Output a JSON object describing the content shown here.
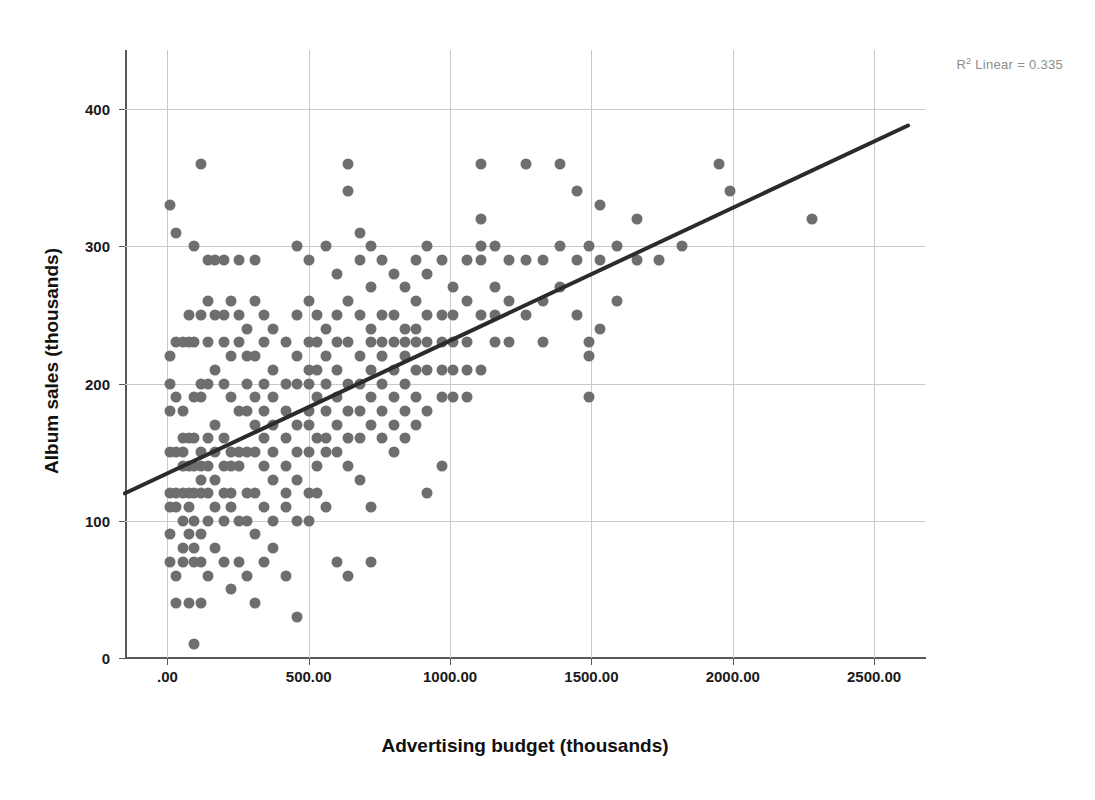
{
  "chart_data": {
    "type": "scatter",
    "title": "",
    "xlabel": "Advertising budget (thousands)",
    "ylabel": "Album sales (thousands)",
    "xlim": [
      -150,
      2680
    ],
    "ylim": [
      0,
      443
    ],
    "grid": true,
    "legend": "none",
    "annotations": [
      {
        "name": "r-squared",
        "text_prefix": "R",
        "text_sup": "2",
        "text_suffix": " Linear = 0.335",
        "value": 0.335,
        "position": "top-right"
      }
    ],
    "xticks": [
      0,
      500,
      1000,
      1500,
      2000,
      2500
    ],
    "xtick_labels": [
      ".00",
      "500.00",
      "1000.00",
      "1500.00",
      "2000.00",
      "2500.00"
    ],
    "yticks": [
      0,
      100,
      200,
      300,
      400
    ],
    "ytick_labels": [
      "0",
      "100",
      "200",
      "300",
      "400"
    ],
    "series": [
      {
        "name": "Album sales vs Advertising budget",
        "marker": "circle",
        "color": "#6e6e6e",
        "points": [
          [
            10,
            330
          ],
          [
            10,
            220
          ],
          [
            10,
            200
          ],
          [
            10,
            180
          ],
          [
            10,
            150
          ],
          [
            10,
            120
          ],
          [
            10,
            110
          ],
          [
            10,
            90
          ],
          [
            10,
            70
          ],
          [
            30,
            310
          ],
          [
            30,
            230
          ],
          [
            30,
            190
          ],
          [
            30,
            150
          ],
          [
            30,
            120
          ],
          [
            30,
            110
          ],
          [
            30,
            60
          ],
          [
            30,
            40
          ],
          [
            55,
            230
          ],
          [
            55,
            180
          ],
          [
            55,
            160
          ],
          [
            55,
            150
          ],
          [
            55,
            140
          ],
          [
            55,
            120
          ],
          [
            55,
            100
          ],
          [
            55,
            80
          ],
          [
            55,
            70
          ],
          [
            75,
            250
          ],
          [
            75,
            230
          ],
          [
            75,
            160
          ],
          [
            75,
            140
          ],
          [
            75,
            120
          ],
          [
            75,
            110
          ],
          [
            75,
            90
          ],
          [
            75,
            40
          ],
          [
            95,
            300
          ],
          [
            95,
            230
          ],
          [
            95,
            190
          ],
          [
            95,
            160
          ],
          [
            95,
            140
          ],
          [
            95,
            120
          ],
          [
            95,
            100
          ],
          [
            95,
            80
          ],
          [
            95,
            70
          ],
          [
            95,
            10
          ],
          [
            120,
            360
          ],
          [
            120,
            250
          ],
          [
            120,
            200
          ],
          [
            120,
            190
          ],
          [
            120,
            150
          ],
          [
            120,
            140
          ],
          [
            120,
            130
          ],
          [
            120,
            120
          ],
          [
            120,
            90
          ],
          [
            120,
            70
          ],
          [
            120,
            40
          ],
          [
            145,
            290
          ],
          [
            145,
            260
          ],
          [
            145,
            230
          ],
          [
            145,
            200
          ],
          [
            145,
            160
          ],
          [
            145,
            140
          ],
          [
            145,
            120
          ],
          [
            145,
            100
          ],
          [
            145,
            60
          ],
          [
            170,
            290
          ],
          [
            170,
            250
          ],
          [
            170,
            210
          ],
          [
            170,
            170
          ],
          [
            170,
            150
          ],
          [
            170,
            130
          ],
          [
            170,
            110
          ],
          [
            170,
            80
          ],
          [
            200,
            290
          ],
          [
            200,
            250
          ],
          [
            200,
            230
          ],
          [
            200,
            200
          ],
          [
            200,
            160
          ],
          [
            200,
            140
          ],
          [
            200,
            120
          ],
          [
            200,
            100
          ],
          [
            200,
            70
          ],
          [
            225,
            260
          ],
          [
            225,
            220
          ],
          [
            225,
            190
          ],
          [
            225,
            150
          ],
          [
            225,
            140
          ],
          [
            225,
            120
          ],
          [
            225,
            110
          ],
          [
            225,
            50
          ],
          [
            255,
            290
          ],
          [
            255,
            250
          ],
          [
            255,
            230
          ],
          [
            255,
            180
          ],
          [
            255,
            150
          ],
          [
            255,
            140
          ],
          [
            255,
            100
          ],
          [
            255,
            70
          ],
          [
            280,
            240
          ],
          [
            280,
            220
          ],
          [
            280,
            200
          ],
          [
            280,
            180
          ],
          [
            280,
            150
          ],
          [
            280,
            120
          ],
          [
            280,
            100
          ],
          [
            280,
            60
          ],
          [
            310,
            290
          ],
          [
            310,
            260
          ],
          [
            310,
            220
          ],
          [
            310,
            190
          ],
          [
            310,
            170
          ],
          [
            310,
            150
          ],
          [
            310,
            120
          ],
          [
            310,
            90
          ],
          [
            310,
            40
          ],
          [
            340,
            250
          ],
          [
            340,
            230
          ],
          [
            340,
            200
          ],
          [
            340,
            180
          ],
          [
            340,
            160
          ],
          [
            340,
            140
          ],
          [
            340,
            110
          ],
          [
            340,
            70
          ],
          [
            375,
            240
          ],
          [
            375,
            210
          ],
          [
            375,
            190
          ],
          [
            375,
            170
          ],
          [
            375,
            150
          ],
          [
            375,
            130
          ],
          [
            375,
            100
          ],
          [
            375,
            80
          ],
          [
            420,
            230
          ],
          [
            420,
            200
          ],
          [
            420,
            180
          ],
          [
            420,
            160
          ],
          [
            420,
            140
          ],
          [
            420,
            120
          ],
          [
            420,
            110
          ],
          [
            420,
            60
          ],
          [
            460,
            300
          ],
          [
            460,
            250
          ],
          [
            460,
            220
          ],
          [
            460,
            200
          ],
          [
            460,
            170
          ],
          [
            460,
            150
          ],
          [
            460,
            130
          ],
          [
            460,
            100
          ],
          [
            460,
            30
          ],
          [
            500,
            290
          ],
          [
            500,
            260
          ],
          [
            500,
            230
          ],
          [
            500,
            210
          ],
          [
            500,
            200
          ],
          [
            500,
            180
          ],
          [
            500,
            170
          ],
          [
            500,
            150
          ],
          [
            500,
            120
          ],
          [
            500,
            100
          ],
          [
            530,
            250
          ],
          [
            530,
            230
          ],
          [
            530,
            210
          ],
          [
            530,
            190
          ],
          [
            530,
            160
          ],
          [
            530,
            140
          ],
          [
            530,
            120
          ],
          [
            560,
            300
          ],
          [
            560,
            240
          ],
          [
            560,
            220
          ],
          [
            560,
            200
          ],
          [
            560,
            180
          ],
          [
            560,
            160
          ],
          [
            560,
            150
          ],
          [
            560,
            110
          ],
          [
            600,
            280
          ],
          [
            600,
            250
          ],
          [
            600,
            230
          ],
          [
            600,
            210
          ],
          [
            600,
            190
          ],
          [
            600,
            170
          ],
          [
            600,
            150
          ],
          [
            600,
            70
          ],
          [
            640,
            360
          ],
          [
            640,
            340
          ],
          [
            640,
            260
          ],
          [
            640,
            230
          ],
          [
            640,
            200
          ],
          [
            640,
            180
          ],
          [
            640,
            160
          ],
          [
            640,
            140
          ],
          [
            640,
            60
          ],
          [
            680,
            310
          ],
          [
            680,
            290
          ],
          [
            680,
            250
          ],
          [
            680,
            220
          ],
          [
            680,
            200
          ],
          [
            680,
            180
          ],
          [
            680,
            160
          ],
          [
            680,
            130
          ],
          [
            720,
            300
          ],
          [
            720,
            270
          ],
          [
            720,
            240
          ],
          [
            720,
            230
          ],
          [
            720,
            210
          ],
          [
            720,
            190
          ],
          [
            720,
            170
          ],
          [
            720,
            110
          ],
          [
            720,
            70
          ],
          [
            760,
            290
          ],
          [
            760,
            250
          ],
          [
            760,
            230
          ],
          [
            760,
            220
          ],
          [
            760,
            200
          ],
          [
            760,
            180
          ],
          [
            760,
            160
          ],
          [
            800,
            280
          ],
          [
            800,
            250
          ],
          [
            800,
            230
          ],
          [
            800,
            210
          ],
          [
            800,
            190
          ],
          [
            800,
            170
          ],
          [
            800,
            150
          ],
          [
            840,
            270
          ],
          [
            840,
            240
          ],
          [
            840,
            230
          ],
          [
            840,
            220
          ],
          [
            840,
            200
          ],
          [
            840,
            180
          ],
          [
            840,
            160
          ],
          [
            880,
            290
          ],
          [
            880,
            260
          ],
          [
            880,
            240
          ],
          [
            880,
            230
          ],
          [
            880,
            210
          ],
          [
            880,
            190
          ],
          [
            880,
            170
          ],
          [
            920,
            300
          ],
          [
            920,
            280
          ],
          [
            920,
            250
          ],
          [
            920,
            230
          ],
          [
            920,
            210
          ],
          [
            920,
            180
          ],
          [
            920,
            120
          ],
          [
            970,
            290
          ],
          [
            970,
            250
          ],
          [
            970,
            230
          ],
          [
            970,
            210
          ],
          [
            970,
            190
          ],
          [
            970,
            140
          ],
          [
            1010,
            270
          ],
          [
            1010,
            250
          ],
          [
            1010,
            230
          ],
          [
            1010,
            210
          ],
          [
            1010,
            190
          ],
          [
            1060,
            290
          ],
          [
            1060,
            260
          ],
          [
            1060,
            230
          ],
          [
            1060,
            210
          ],
          [
            1060,
            190
          ],
          [
            1110,
            360
          ],
          [
            1110,
            320
          ],
          [
            1110,
            300
          ],
          [
            1110,
            290
          ],
          [
            1110,
            250
          ],
          [
            1110,
            210
          ],
          [
            1160,
            300
          ],
          [
            1160,
            270
          ],
          [
            1160,
            250
          ],
          [
            1160,
            230
          ],
          [
            1210,
            290
          ],
          [
            1210,
            260
          ],
          [
            1210,
            230
          ],
          [
            1270,
            360
          ],
          [
            1270,
            290
          ],
          [
            1270,
            250
          ],
          [
            1330,
            290
          ],
          [
            1330,
            260
          ],
          [
            1330,
            230
          ],
          [
            1390,
            360
          ],
          [
            1390,
            300
          ],
          [
            1390,
            270
          ],
          [
            1450,
            340
          ],
          [
            1450,
            290
          ],
          [
            1450,
            250
          ],
          [
            1490,
            300
          ],
          [
            1490,
            230
          ],
          [
            1490,
            220
          ],
          [
            1490,
            190
          ],
          [
            1530,
            330
          ],
          [
            1530,
            290
          ],
          [
            1530,
            240
          ],
          [
            1590,
            300
          ],
          [
            1590,
            260
          ],
          [
            1660,
            320
          ],
          [
            1660,
            290
          ],
          [
            1740,
            290
          ],
          [
            1820,
            300
          ],
          [
            1950,
            360
          ],
          [
            1990,
            340
          ],
          [
            2280,
            320
          ]
        ]
      }
    ],
    "fit_line": {
      "name": "linear-regression",
      "color": "#2b2b2b",
      "r_squared": 0.335,
      "x_start": -150,
      "y_start": 120,
      "x_end": 2620,
      "y_end": 388
    }
  }
}
